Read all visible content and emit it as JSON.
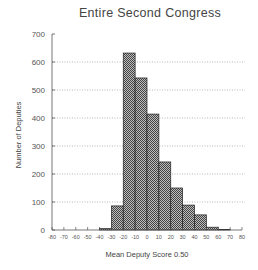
{
  "chart_data": {
    "type": "bar",
    "title": "Entire Second Congress",
    "xlabel": "Mean Deputy Score 0.50",
    "ylabel": "Number of Deputies",
    "xlim": [
      -80,
      80
    ],
    "ylim": [
      0,
      700
    ],
    "x_ticks": [
      -80,
      -70,
      -60,
      -50,
      -40,
      -30,
      -20,
      -10,
      0,
      10,
      20,
      30,
      40,
      50,
      60,
      70,
      80
    ],
    "y_ticks": [
      0,
      100,
      200,
      300,
      400,
      500,
      600,
      700
    ],
    "grid": "horizontal dotted",
    "bin_width": 10,
    "categories": [
      "-40 to -30",
      "-30 to -20",
      "-20 to -10",
      "-10 to 0",
      "0 to 10",
      "10 to 20",
      "20 to 30",
      "30 to 40",
      "40 to 50",
      "50 to 60",
      "60 to 70"
    ],
    "bins": [
      {
        "start": -40,
        "end": -30,
        "value": 5
      },
      {
        "start": -30,
        "end": -20,
        "value": 86
      },
      {
        "start": -20,
        "end": -10,
        "value": 632
      },
      {
        "start": -10,
        "end": 0,
        "value": 543
      },
      {
        "start": 0,
        "end": 10,
        "value": 414
      },
      {
        "start": 10,
        "end": 20,
        "value": 243
      },
      {
        "start": 20,
        "end": 30,
        "value": 150
      },
      {
        "start": 30,
        "end": 40,
        "value": 89
      },
      {
        "start": 40,
        "end": 50,
        "value": 54
      },
      {
        "start": 50,
        "end": 60,
        "value": 10
      },
      {
        "start": 60,
        "end": 70,
        "value": 2
      }
    ],
    "values": [
      5,
      86,
      632,
      543,
      414,
      243,
      150,
      89,
      54,
      10,
      2
    ],
    "bar_fill": "crosshatch gray",
    "colors": {
      "bar": "#8a8a8a",
      "bar_edge": "#222222",
      "axis": "#555555",
      "grid": "#888888"
    }
  }
}
